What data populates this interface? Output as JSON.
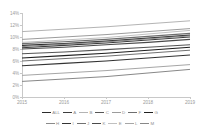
{
  "chart_data": {
    "type": "line",
    "title": "",
    "subtitle": "",
    "xlabel": "",
    "ylabel": "",
    "x": [
      2015,
      2016,
      2017,
      2018,
      2019
    ],
    "x_tick_labels": [
      "2015",
      "2016",
      "2017",
      "2018",
      "2019"
    ],
    "y_tick_labels": [
      "0%",
      "2%",
      "4%",
      "6%",
      "8%",
      "10%",
      "12%",
      "14%"
    ],
    "y_tick_values": [
      0,
      2,
      4,
      6,
      8,
      10,
      12,
      14
    ],
    "ylim": [
      0,
      14
    ],
    "xlim": [
      2015,
      2019
    ],
    "grid": false,
    "legend_position": "bottom",
    "legend_rows": 2,
    "value_suffix": "%",
    "series": [
      {
        "name": "ALL",
        "color": "#2b2b2b",
        "width": 1.25,
        "values": [
          8.6,
          8.9,
          9.3,
          9.8,
          10.3
        ]
      },
      {
        "name": "A",
        "color": "#3d3d3d",
        "width": 1.15,
        "values": [
          8.2,
          8.6,
          9.0,
          9.5,
          10.0
        ]
      },
      {
        "name": "B",
        "color": "#b4b4b4",
        "width": 1.0,
        "values": [
          10.9,
          11.3,
          11.7,
          12.2,
          12.7
        ]
      },
      {
        "name": "C",
        "color": "#565656",
        "width": 1.1,
        "values": [
          7.2,
          7.5,
          7.9,
          8.3,
          8.7
        ]
      },
      {
        "name": "D",
        "color": "#9c9c9c",
        "width": 1.0,
        "values": [
          9.6,
          10.0,
          10.4,
          10.9,
          11.4
        ]
      },
      {
        "name": "F",
        "color": "#6e6e6e",
        "width": 1.1,
        "values": [
          8.9,
          9.2,
          9.6,
          10.1,
          10.6
        ]
      },
      {
        "name": "G",
        "color": "#1f1f1f",
        "width": 1.15,
        "values": [
          6.5,
          6.9,
          7.3,
          7.8,
          8.3
        ]
      },
      {
        "name": "H",
        "color": "#8a8a8a",
        "width": 1.0,
        "values": [
          8.4,
          8.8,
          9.2,
          9.7,
          10.2
        ]
      },
      {
        "name": "I",
        "color": "#333333",
        "width": 1.1,
        "values": [
          5.2,
          5.6,
          6.0,
          6.5,
          7.0
        ]
      },
      {
        "name": "J",
        "color": "#717171",
        "width": 1.0,
        "values": [
          6.0,
          6.4,
          6.8,
          7.3,
          7.8
        ]
      },
      {
        "name": "K",
        "color": "#4a4a4a",
        "width": 1.1,
        "values": [
          8.0,
          8.3,
          8.7,
          9.1,
          9.6
        ]
      },
      {
        "name": "E",
        "color": "#c0c0c0",
        "width": 1.0,
        "values": [
          9.1,
          9.5,
          9.9,
          10.5,
          11.1
        ]
      },
      {
        "name": "L",
        "color": "#a6a6a6",
        "width": 1.0,
        "values": [
          3.6,
          4.0,
          4.4,
          4.9,
          5.4
        ]
      },
      {
        "name": "M",
        "color": "#888888",
        "width": 1.0,
        "values": [
          2.6,
          3.0,
          3.4,
          4.0,
          4.6
        ]
      }
    ]
  },
  "axis": {
    "y_title": "",
    "x_title": ""
  }
}
